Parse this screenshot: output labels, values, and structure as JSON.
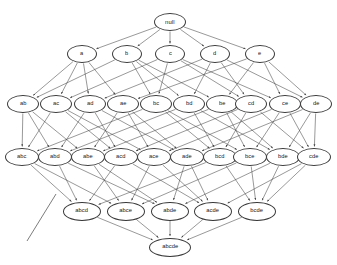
{
  "diagram": {
    "type": "hasse-lattice",
    "title": "",
    "universe": [
      "a",
      "b",
      "c",
      "d",
      "e"
    ],
    "background_color": "#ffffff",
    "node_stroke_color": "#3a3a3a",
    "edge_color": "#444444",
    "label_color": "#151515",
    "levels": [
      {
        "index": 0,
        "size": 0,
        "y": 22,
        "nodes": [
          {
            "id": "null",
            "label": "null",
            "x": 170,
            "w": 32,
            "h": 18,
            "font": 6.0
          }
        ]
      },
      {
        "index": 1,
        "size": 1,
        "y": 54,
        "nodes": [
          {
            "id": "a",
            "label": "a",
            "x": 82,
            "w": 30,
            "h": 18,
            "font": 5.8
          },
          {
            "id": "b",
            "label": "b",
            "x": 127,
            "w": 30,
            "h": 18,
            "font": 5.8
          },
          {
            "id": "c",
            "label": "c",
            "x": 170,
            "w": 30,
            "h": 18,
            "font": 5.8
          },
          {
            "id": "d",
            "label": "d",
            "x": 215,
            "w": 30,
            "h": 18,
            "font": 5.8
          },
          {
            "id": "e",
            "label": "e",
            "x": 260,
            "w": 30,
            "h": 18,
            "font": 5.8
          }
        ]
      },
      {
        "index": 2,
        "size": 2,
        "y": 104,
        "nodes": [
          {
            "id": "ab",
            "label": "ab",
            "x": 23,
            "w": 32,
            "h": 18,
            "font": 5.8
          },
          {
            "id": "ac",
            "label": "ac",
            "x": 56,
            "w": 32,
            "h": 18,
            "font": 5.8
          },
          {
            "id": "ad",
            "label": "ad",
            "x": 90,
            "w": 32,
            "h": 18,
            "font": 5.8
          },
          {
            "id": "ae",
            "label": "ae",
            "x": 123,
            "w": 32,
            "h": 18,
            "font": 5.8
          },
          {
            "id": "bc",
            "label": "bc",
            "x": 156,
            "w": 32,
            "h": 18,
            "font": 5.8
          },
          {
            "id": "bd",
            "label": "bd",
            "x": 189,
            "w": 32,
            "h": 18,
            "font": 5.8
          },
          {
            "id": "be",
            "label": "be",
            "x": 222,
            "w": 32,
            "h": 18,
            "font": 5.8
          },
          {
            "id": "cd",
            "label": "cd",
            "x": 251,
            "w": 32,
            "h": 18,
            "font": 5.8
          },
          {
            "id": "ce",
            "label": "ce",
            "x": 285,
            "w": 32,
            "h": 18,
            "font": 5.8
          },
          {
            "id": "de",
            "label": "de",
            "x": 316,
            "w": 32,
            "h": 18,
            "font": 5.8
          }
        ]
      },
      {
        "index": 3,
        "size": 3,
        "y": 157,
        "nodes": [
          {
            "id": "abc",
            "label": "abc",
            "x": 22,
            "w": 34,
            "h": 18,
            "font": 5.8
          },
          {
            "id": "abd",
            "label": "abd",
            "x": 55,
            "w": 34,
            "h": 18,
            "font": 5.8
          },
          {
            "id": "abe",
            "label": "abe",
            "x": 88,
            "w": 34,
            "h": 18,
            "font": 5.8
          },
          {
            "id": "acd",
            "label": "acd",
            "x": 121,
            "w": 34,
            "h": 18,
            "font": 5.8
          },
          {
            "id": "ace",
            "label": "ace",
            "x": 154,
            "w": 34,
            "h": 18,
            "font": 5.8
          },
          {
            "id": "ade",
            "label": "ade",
            "x": 187,
            "w": 34,
            "h": 18,
            "font": 5.8
          },
          {
            "id": "bcd",
            "label": "bcd",
            "x": 220,
            "w": 34,
            "h": 18,
            "font": 5.8
          },
          {
            "id": "bce",
            "label": "bce",
            "x": 250,
            "w": 34,
            "h": 18,
            "font": 5.8
          },
          {
            "id": "bde",
            "label": "bde",
            "x": 283,
            "w": 34,
            "h": 18,
            "font": 5.8
          },
          {
            "id": "cde",
            "label": "cde",
            "x": 314,
            "w": 34,
            "h": 18,
            "font": 5.8
          }
        ]
      },
      {
        "index": 4,
        "size": 4,
        "y": 211,
        "nodes": [
          {
            "id": "abcd",
            "label": "abcd",
            "x": 82,
            "w": 38,
            "h": 19,
            "font": 5.9
          },
          {
            "id": "abce",
            "label": "abce",
            "x": 126,
            "w": 38,
            "h": 19,
            "font": 5.9
          },
          {
            "id": "abde",
            "label": "abde",
            "x": 170,
            "w": 38,
            "h": 19,
            "font": 5.9
          },
          {
            "id": "acde",
            "label": "acde",
            "x": 213,
            "w": 38,
            "h": 19,
            "font": 5.9
          },
          {
            "id": "bcde",
            "label": "bcde",
            "x": 257,
            "w": 38,
            "h": 19,
            "font": 5.9
          }
        ]
      },
      {
        "index": 5,
        "size": 5,
        "y": 247,
        "nodes": [
          {
            "id": "abcde",
            "label": "abcde",
            "x": 170,
            "w": 42,
            "h": 19,
            "font": 5.9
          }
        ]
      }
    ],
    "stray_line": {
      "x1": 56,
      "y1": 194,
      "x2": 27,
      "y2": 241
    }
  }
}
